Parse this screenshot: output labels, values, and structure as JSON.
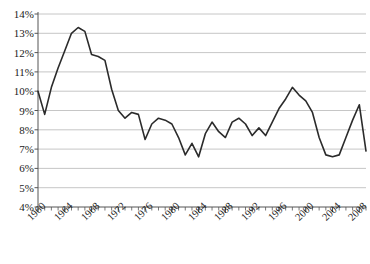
{
  "chart_data": {
    "type": "line",
    "title": "",
    "subtitle": "",
    "xlabel": "",
    "ylabel": "",
    "grid": true,
    "legend": "none",
    "xlim": [
      1960,
      2009
    ],
    "ylim": [
      4,
      14
    ],
    "ytick_labels": [
      "14%",
      "13%",
      "12%",
      "11%",
      "10%",
      "9%",
      "8%",
      "7%",
      "6%",
      "5%",
      "4%"
    ],
    "ytick_values": [
      14,
      13,
      12,
      11,
      10,
      9,
      8,
      7,
      6,
      5,
      4
    ],
    "xtick_labels": [
      "1960",
      "1964",
      "1968",
      "1972",
      "1976",
      "1980",
      "1984",
      "1988",
      "1992",
      "1996",
      "2000",
      "2004",
      "2008"
    ],
    "xtick_values": [
      1960,
      1964,
      1968,
      1972,
      1976,
      1980,
      1984,
      1988,
      1992,
      1996,
      2000,
      2004,
      2008
    ],
    "minor_xtick_interval": 1,
    "line_color": "#2b2b2b",
    "grid_color": "#b8b8b8",
    "axis_color": "#555555",
    "x": [
      1960,
      1961,
      1962,
      1963,
      1964,
      1965,
      1966,
      1967,
      1968,
      1969,
      1970,
      1971,
      1972,
      1973,
      1974,
      1975,
      1976,
      1977,
      1978,
      1979,
      1980,
      1981,
      1982,
      1983,
      1984,
      1985,
      1986,
      1987,
      1988,
      1989,
      1990,
      1991,
      1992,
      1993,
      1994,
      1995,
      1996,
      1997,
      1998,
      1999,
      2000,
      2001,
      2002,
      2003,
      2004,
      2005,
      2006,
      2007,
      2008,
      2009
    ],
    "values": [
      10.0,
      8.8,
      10.2,
      11.2,
      12.1,
      13.0,
      13.3,
      13.1,
      11.9,
      11.8,
      11.6,
      10.1,
      9.0,
      8.6,
      8.9,
      8.8,
      7.5,
      8.3,
      8.6,
      8.5,
      8.3,
      7.6,
      6.7,
      7.3,
      6.6,
      7.8,
      8.4,
      7.9,
      7.6,
      8.4,
      8.6,
      8.3,
      7.7,
      8.1,
      7.7,
      8.4,
      9.1,
      9.6,
      10.2,
      9.8,
      9.5,
      8.9,
      7.6,
      6.7,
      6.6,
      6.7,
      7.6,
      8.5,
      9.3,
      6.9
    ]
  }
}
